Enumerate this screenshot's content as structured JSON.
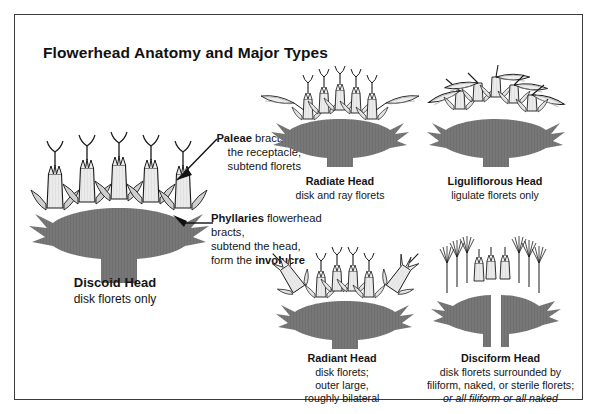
{
  "title": "Flowerhead Anatomy and Major Types",
  "colors": {
    "receptacle_gray": "#777777",
    "floret_light": "#ebebeb",
    "palea_gray": "#cfcfcf",
    "outline": "#1a1a1a",
    "border": "#3a3a3a",
    "background": "#ffffff"
  },
  "callouts": [
    {
      "id": "paleae",
      "heading": "Paleae",
      "lines": [
        "bracts on",
        "the receptacle,",
        "subtend florets"
      ],
      "arrow": "arrow-pointing-left"
    },
    {
      "id": "phyllaries",
      "heading": "Phyllaries",
      "lines": [
        "flowerhead bracts,",
        "subtend the head,",
        "form the involucre"
      ],
      "emphasis": "involucre",
      "arrow": "arrow-pointing-upper-left"
    }
  ],
  "figures": [
    {
      "id": "discoid",
      "heading": "Discoid Head",
      "lines": [
        "disk florets only"
      ],
      "type": "discoid"
    },
    {
      "id": "radiate",
      "heading": "Radiate Head",
      "lines": [
        "disk and ray florets"
      ],
      "type": "radiate"
    },
    {
      "id": "liguliflorous",
      "heading": "Liguliflorous Head",
      "lines": [
        "ligulate florets only"
      ],
      "type": "liguliflorous"
    },
    {
      "id": "radiant",
      "heading": "Radiant Head",
      "lines": [
        "disk florets;",
        "outer large,",
        "roughly bilateral"
      ],
      "type": "radiant"
    },
    {
      "id": "disciform",
      "heading": "Disciform Head",
      "lines": [
        "disk florets surrounded by",
        "filiform, naked, or sterile florets;"
      ],
      "italic_line": "or all filiform or all naked",
      "type": "disciform"
    }
  ]
}
